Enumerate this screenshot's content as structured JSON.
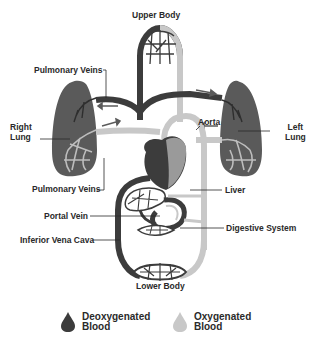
{
  "diagram": {
    "labels": {
      "upper_body": "Upper Body",
      "pulmonary_veins_top": "Pulmonary Veins",
      "right_lung_1": "Right",
      "right_lung_2": "Lung",
      "left_lung_1": "Left",
      "left_lung_2": "Lung",
      "aorta": "Aorta",
      "pulmonary_veins_bottom": "Pulmonary Veins",
      "liver": "Liver",
      "portal_vein": "Portal Vein",
      "digestive_system": "Digestive System",
      "inferior_vena_cava": "Inferior Vena Cava",
      "lower_body": "Lower Body"
    },
    "colors": {
      "deoxygenated": "#3c3c3c",
      "oxygenated": "#c8c8c8",
      "lung": "#5a5a5a",
      "text": "#2a2a2a"
    }
  },
  "legend": {
    "items": [
      {
        "label": "Deoxygenated Blood",
        "line1": "Deoxygenated",
        "line2": "Blood",
        "color": "#3c3c3c"
      },
      {
        "label": "Oxygenated Blood",
        "line1": "Oxygenated",
        "line2": "Blood",
        "color": "#c8c8c8"
      }
    ]
  }
}
